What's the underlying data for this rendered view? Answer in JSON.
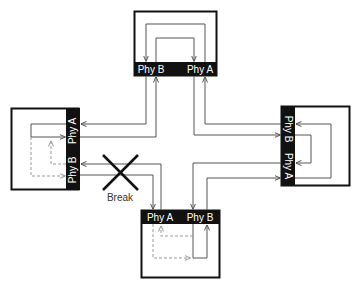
{
  "diagram": {
    "type": "ring-topology-with-break",
    "colors": {
      "box_border": "#111111",
      "port_bar": "#111111",
      "port_text": "#ffffff",
      "line": "#555555",
      "dashed_line": "#999999",
      "break_cross": "#111111",
      "break_text": "#333333"
    },
    "nodes": [
      {
        "id": "top",
        "ports": [
          {
            "label": "Phy B"
          },
          {
            "label": "Phy A"
          }
        ]
      },
      {
        "id": "left",
        "ports": [
          {
            "label": "Phy A"
          },
          {
            "label": "Phy B"
          }
        ]
      },
      {
        "id": "right",
        "ports": [
          {
            "label": "Phy B"
          },
          {
            "label": "Phy A"
          }
        ]
      },
      {
        "id": "bottom",
        "ports": [
          {
            "label": "Phy A"
          },
          {
            "label": "Phy B"
          }
        ]
      }
    ],
    "break": {
      "label": "Break",
      "location": "link between left Phy B and bottom Phy A"
    }
  }
}
